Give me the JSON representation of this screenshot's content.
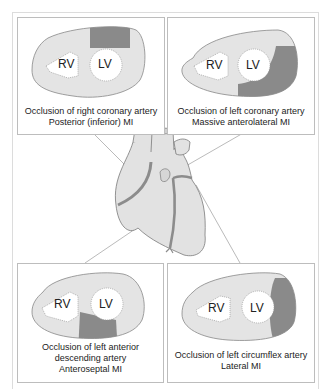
{
  "colors": {
    "myocardium": "#e4e4e4",
    "infarct": "#8a8a8a",
    "outline": "#888888",
    "panel_border": "#bdbdbd",
    "heart_fill": "#e2e2e2",
    "artery": "#8c8c8c",
    "leader_line": "#a8a8a8"
  },
  "panels": [
    {
      "id": "top-left",
      "rv_label": "RV",
      "lv_label": "LV",
      "caption_line1": "Occlusion of right coronary artery",
      "caption_line2": "Posterior (inferior) MI",
      "infarct_region": "posterior (top of LV)"
    },
    {
      "id": "top-right",
      "rv_label": "RV",
      "lv_label": "LV",
      "caption_line1": "Occlusion of left coronary artery",
      "caption_line2": "Massive anterolateral MI",
      "infarct_region": "anterolateral (right and lower LV wall)"
    },
    {
      "id": "bottom-left",
      "rv_label": "RV",
      "lv_label": "LV",
      "caption_line1": "Occlusion of left anterior",
      "caption_line2": "descending artery",
      "caption_line3": "Anteroseptal MI",
      "infarct_region": "anteroseptal (below septum)"
    },
    {
      "id": "bottom-right",
      "rv_label": "RV",
      "lv_label": "LV",
      "caption_line1": "Occlusion of left circumflex artery",
      "caption_line2": "Lateral MI",
      "infarct_region": "lateral (right edge of LV)"
    }
  ]
}
